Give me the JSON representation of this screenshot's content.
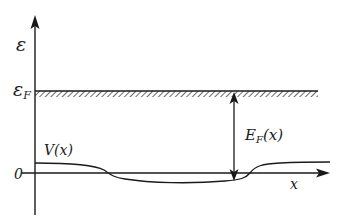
{
  "diagram": {
    "type": "energy-band-diagram",
    "labels": {
      "y_axis": "ε",
      "fermi_level": "ε",
      "fermi_level_sub": "F",
      "potential": "V(x)",
      "local_fermi_energy": "E",
      "local_fermi_energy_sub": "F",
      "local_fermi_energy_arg": "(x)",
      "origin": "0",
      "x_axis": "x"
    },
    "elements": [
      {
        "id": "y-axis",
        "description": "vertical energy axis with arrow"
      },
      {
        "id": "x-axis",
        "description": "horizontal position axis with arrow"
      },
      {
        "id": "fermi-level",
        "description": "horizontal hatched line at ε_F"
      },
      {
        "id": "potential-curve",
        "description": "V(x): positive at left, dips below zero in middle, positive at right"
      },
      {
        "id": "ef-double-arrow",
        "description": "vertical double arrow from V(x) to ε_F labeled E_F(x)"
      }
    ],
    "colors": {
      "ink": "#1a1a1a",
      "background": "#ffffff"
    }
  }
}
